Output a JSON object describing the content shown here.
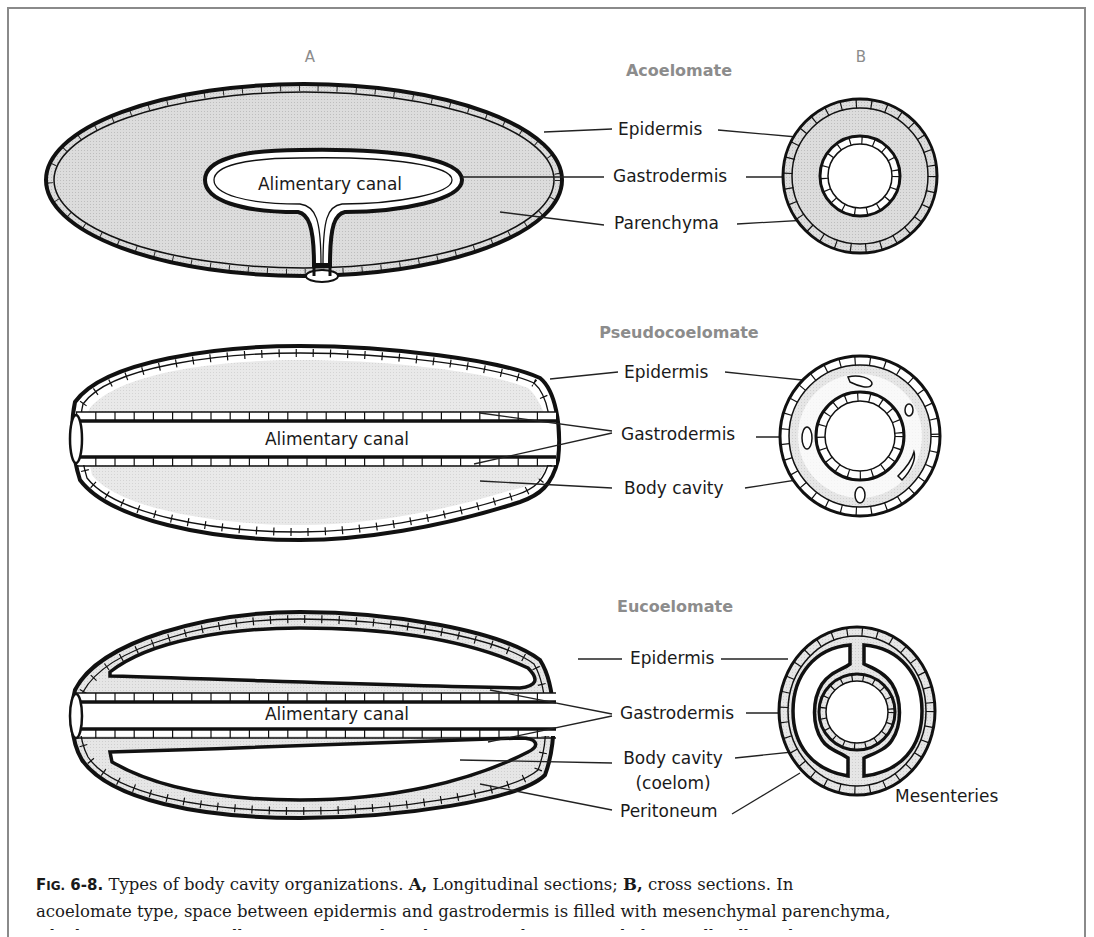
{
  "figure": {
    "panel_labels": {
      "a": "A",
      "b": "B"
    },
    "sections": [
      {
        "title": "Acoelomate",
        "labels": {
          "epidermis": "Epidermis",
          "gastrodermis": "Gastrodermis",
          "parenchyma": "Parenchyma",
          "alimentary_canal": "Alimentary canal"
        }
      },
      {
        "title": "Pseudocoelomate",
        "labels": {
          "epidermis": "Epidermis",
          "gastrodermis": "Gastrodermis",
          "body_cavity": "Body cavity",
          "alimentary_canal": "Alimentary canal"
        }
      },
      {
        "title": "Eucoelomate",
        "labels": {
          "epidermis": "Epidermis",
          "gastrodermis": "Gastrodermis",
          "body_cavity_line1": "Body cavity",
          "body_cavity_line2": "(coelom)",
          "peritoneum": "Peritoneum",
          "mesenteries": "Mesenteries",
          "alimentary_canal": "Alimentary canal"
        }
      }
    ],
    "colors": {
      "outline": "#111111",
      "fill_gray": "#d9d9d9",
      "title_gray": "#8c8c8c",
      "frame": "#8a8a8a"
    }
  },
  "caption": {
    "fig_prefix": "F",
    "fig_prefix_small": "IG.",
    "fig_number": " 6-8.",
    "text1": " Types of body cavity organizations. ",
    "a_label": "A,",
    "text2": " Longitudinal sections; ",
    "b_label": "B,",
    "text3": " cross sections. In",
    "line2": "acoelomate type, space between epidermis and gastrodermis is filled with mesenchymal parenchyma,",
    "line3_partial": "which may contain small spaces in some broad anatomical groups and also small cells and"
  }
}
